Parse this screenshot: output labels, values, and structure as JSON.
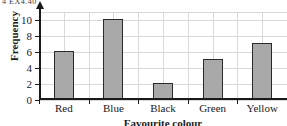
{
  "header_remnant": "4  EX4.40",
  "chart_data": {
    "type": "bar",
    "title": "",
    "categories": [
      "Red",
      "Blue",
      "Black",
      "Green",
      "Yellow"
    ],
    "values": [
      6,
      10,
      2,
      5,
      7
    ],
    "xlabel": "Favourite colour",
    "ylabel": "Frequency",
    "ylim": [
      0,
      11
    ],
    "yticks": [
      0,
      2,
      4,
      6,
      8,
      10
    ],
    "ytick_labels": [
      "0",
      "2",
      "4",
      "6",
      "8",
      "10"
    ],
    "grid": true,
    "legend": "none",
    "bar_fill_color": "#a9a9a9",
    "bar_edge_color": "#2a2a2a",
    "grid_color": "#d9d9d9",
    "axis_color": "#1a1a1a"
  }
}
